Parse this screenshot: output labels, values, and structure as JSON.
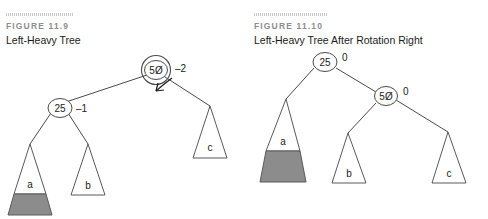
{
  "figures": [
    {
      "label": "FIGURE 11.9",
      "title": "Left-Heavy Tree",
      "nodes": {
        "root": {
          "key": "5Ø",
          "balance": "–2",
          "highlighted": true
        },
        "child": {
          "key": "25",
          "balance": "–1",
          "highlighted": false
        }
      },
      "subtrees": [
        {
          "name": "a",
          "shaded": true
        },
        {
          "name": "b",
          "shaded": false
        },
        {
          "name": "c",
          "shaded": false
        }
      ]
    },
    {
      "label": "FIGURE 11.10",
      "title": "Left-Heavy Tree After Rotation Right",
      "nodes": {
        "root": {
          "key": "25",
          "balance": "0",
          "highlighted": false
        },
        "child": {
          "key": "5Ø",
          "balance": "0",
          "highlighted": false
        }
      },
      "subtrees": [
        {
          "name": "a",
          "shaded": true
        },
        {
          "name": "b",
          "shaded": false
        },
        {
          "name": "c",
          "shaded": false
        }
      ]
    }
  ],
  "colors": {
    "ink": "#1b1b1b",
    "line": "#4a4a4a",
    "shade": "#8c8c8c",
    "label_gray": "#8e8e8e"
  }
}
